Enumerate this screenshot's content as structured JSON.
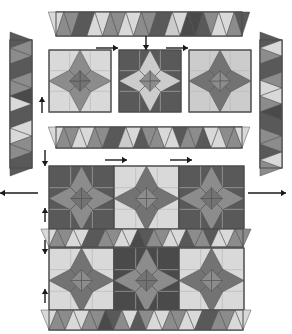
{
  "diagram": {
    "type": "quilt-assembly",
    "canvas": {
      "width": 292,
      "height": 334,
      "background": "#ffffff"
    },
    "palette": {
      "light": "#d9d9d9",
      "light_alt": "#cccccc",
      "medium": "#8c8c8c",
      "medium_dark": "#737373",
      "dark": "#595959",
      "very_dark": "#4a4a4a",
      "outline": "#4d4d4d",
      "arrow": "#1a1a1a",
      "seam": "#b3b3b3"
    },
    "geometry": {
      "unit": 20,
      "block_cells": 3,
      "sawtooth_tooth_width": 16
    }
  },
  "components": {
    "top_sashing_strip": {
      "label": "top sawtooth sashing strip",
      "x": 56,
      "y": 12,
      "width": 186,
      "height": 24,
      "orientation": "horizontal",
      "teeth": 12,
      "tooth_colors": [
        "medium",
        "dark",
        "light",
        "medium",
        "light",
        "medium",
        "dark",
        "light_alt",
        "very_dark",
        "dark",
        "light",
        "medium"
      ],
      "ground_colors": [
        "light",
        "medium",
        "dark",
        "light",
        "medium",
        "light",
        "medium",
        "dark",
        "light",
        "very_dark",
        "medium",
        "light",
        "dark"
      ]
    },
    "left_border_strip": {
      "label": "left sawtooth border strip",
      "x": 10,
      "y": 40,
      "width": 22,
      "height": 128,
      "orientation": "vertical",
      "teeth": 8,
      "tooth_colors": [
        "medium",
        "dark",
        "medium",
        "very_dark",
        "dark",
        "light",
        "medium",
        "dark"
      ],
      "ground_colors": [
        "dark",
        "medium",
        "dark",
        "medium",
        "light",
        "dark",
        "light",
        "medium",
        "dark"
      ]
    },
    "right_border_strip": {
      "label": "right sawtooth border strip",
      "x": 260,
      "y": 40,
      "width": 22,
      "height": 128,
      "orientation": "vertical",
      "teeth": 8,
      "tooth_colors": [
        "light",
        "dark",
        "medium",
        "light",
        "very_dark",
        "dark",
        "medium",
        "light"
      ],
      "ground_colors": [
        "dark",
        "medium",
        "dark",
        "light",
        "medium",
        "dark",
        "medium",
        "dark",
        "medium"
      ]
    },
    "middle_sashing_strip": {
      "label": "middle sawtooth sashing strip",
      "x": 56,
      "y": 127,
      "width": 186,
      "height": 21,
      "orientation": "horizontal",
      "teeth": 12,
      "tooth_colors": [
        "medium",
        "light",
        "medium",
        "dark",
        "light_alt",
        "dark",
        "medium",
        "light",
        "medium",
        "dark",
        "light",
        "medium"
      ],
      "ground_colors": [
        "light",
        "medium",
        "light",
        "medium",
        "dark",
        "light",
        "medium",
        "light",
        "dark",
        "medium",
        "light",
        "medium",
        "light"
      ]
    },
    "star_block_row": {
      "label": "three detached star blocks being joined",
      "y": 50,
      "block_size": 62,
      "blocks": [
        {
          "name": "star-block-left",
          "x": 49,
          "background": "light",
          "star": "medium",
          "center": "medium_dark"
        },
        {
          "name": "star-block-center",
          "x": 119,
          "background": "dark",
          "star": "light_alt",
          "center": "medium"
        },
        {
          "name": "star-block-right",
          "x": 189,
          "background": "light_alt",
          "star": "medium_dark",
          "center": "medium"
        }
      ]
    },
    "main_quilt": {
      "label": "assembled quilt top",
      "x": 49,
      "y": 166,
      "width": 194,
      "height": 160,
      "rows": [
        {
          "name": "quilt-row-top",
          "y": 166,
          "height": 62,
          "blocks": [
            {
              "name": "quilt-block-r1c1",
              "x": 49,
              "background": "dark",
              "star": "medium",
              "center": "medium_dark"
            },
            {
              "name": "quilt-block-r1c2",
              "x": 114,
              "background": "light",
              "star": "medium_dark",
              "center": "medium"
            },
            {
              "name": "quilt-block-r1c3",
              "x": 179,
              "background": "dark",
              "star": "medium",
              "center": "medium_dark"
            }
          ]
        },
        {
          "name": "quilt-row-bottom",
          "y": 248,
          "height": 62,
          "blocks": [
            {
              "name": "quilt-block-r2c1",
              "x": 49,
              "background": "light",
              "star": "medium_dark",
              "center": "medium"
            },
            {
              "name": "quilt-block-r2c2",
              "x": 114,
              "background": "very_dark",
              "star": "medium",
              "center": "medium_dark"
            },
            {
              "name": "quilt-block-r2c3",
              "x": 179,
              "background": "light",
              "star": "medium_dark",
              "center": "medium"
            }
          ]
        }
      ],
      "inner_sashing": {
        "name": "quilt-inner-sawtooth-sashing",
        "x": 49,
        "y": 229,
        "width": 194,
        "height": 18,
        "teeth": 12,
        "tooth_colors": [
          "medium",
          "light",
          "dark",
          "medium",
          "light",
          "very_dark",
          "medium",
          "light",
          "dark",
          "medium",
          "light",
          "medium"
        ],
        "ground_colors": [
          "light",
          "medium",
          "light",
          "dark",
          "medium",
          "light",
          "dark",
          "medium",
          "light",
          "medium",
          "dark",
          "light",
          "medium"
        ]
      },
      "bottom_sashing": {
        "name": "quilt-bottom-sawtooth-sashing",
        "x": 49,
        "y": 310,
        "width": 194,
        "height": 20,
        "teeth": 12,
        "tooth_colors": [
          "medium",
          "light",
          "medium",
          "very_dark",
          "medium",
          "dark",
          "light",
          "medium",
          "light",
          "dark",
          "medium",
          "light"
        ],
        "ground_colors": [
          "light",
          "medium",
          "light",
          "medium",
          "dark",
          "light",
          "medium",
          "light",
          "medium",
          "light",
          "dark",
          "medium",
          "light"
        ]
      }
    }
  },
  "arrows": [
    {
      "name": "arrow-join-top-sashing-down",
      "direction": "down",
      "x": 146,
      "y": 36,
      "length": 14,
      "note": "attach top sashing strip"
    },
    {
      "name": "arrow-join-left-block-right",
      "direction": "right",
      "x": 96,
      "y": 48,
      "length": 22,
      "note": "join left block to center"
    },
    {
      "name": "arrow-join-right-block-left",
      "direction": "right",
      "x": 166,
      "y": 48,
      "length": 22,
      "note": "join right block to center"
    },
    {
      "name": "arrow-left-seam-up-1",
      "direction": "up",
      "x": 42,
      "y": 113,
      "length": 16,
      "note": "press seam up"
    },
    {
      "name": "arrow-left-seam-down-1",
      "direction": "down",
      "x": 45,
      "y": 150,
      "length": 16,
      "note": "press seam down"
    },
    {
      "name": "arrow-row-join-right-1",
      "direction": "right",
      "x": 105,
      "y": 160,
      "length": 22,
      "note": "join row units"
    },
    {
      "name": "arrow-row-join-right-2",
      "direction": "right",
      "x": 170,
      "y": 160,
      "length": 22,
      "note": "join row units"
    },
    {
      "name": "arrow-attach-left-border",
      "direction": "left",
      "x": 38,
      "y": 193,
      "length": 38,
      "note": "attach left border strip"
    },
    {
      "name": "arrow-attach-right-border",
      "direction": "right",
      "x": 248,
      "y": 193,
      "length": 38,
      "note": "attach right border strip"
    },
    {
      "name": "arrow-left-seam-up-2",
      "direction": "up",
      "x": 45,
      "y": 222,
      "length": 14,
      "note": "press seam up"
    },
    {
      "name": "arrow-left-seam-down-2",
      "direction": "down",
      "x": 45,
      "y": 240,
      "length": 14,
      "note": "press seam down"
    },
    {
      "name": "arrow-left-seam-up-3",
      "direction": "up",
      "x": 45,
      "y": 303,
      "length": 14,
      "note": "press seam up"
    }
  ]
}
